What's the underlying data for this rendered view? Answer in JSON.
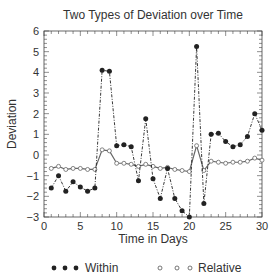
{
  "chart_data": {
    "type": "line",
    "title": "Two Types of Deviation over Time",
    "xlabel": "Time in Days",
    "ylabel": "Deviation",
    "xlim": [
      0,
      30
    ],
    "ylim": [
      -3,
      6
    ],
    "xticks": [
      0,
      5,
      10,
      15,
      20,
      25,
      30
    ],
    "yticks": [
      -3,
      -2,
      -1,
      0,
      1,
      2,
      3,
      4,
      5,
      6
    ],
    "grid": false,
    "legend_position": "bottom",
    "x": [
      1,
      2,
      3,
      4,
      5,
      6,
      7,
      8,
      9,
      10,
      11,
      12,
      13,
      14,
      15,
      16,
      17,
      18,
      19,
      20,
      21,
      22,
      23,
      24,
      25,
      26,
      27,
      28,
      29,
      30
    ],
    "series": [
      {
        "name": "Within",
        "marker": "filled-circle",
        "line": "dash-dot",
        "values": [
          -1.6,
          -1.0,
          -1.75,
          -1.3,
          -1.55,
          -1.75,
          -1.6,
          4.1,
          4.05,
          0.45,
          0.5,
          0.4,
          -1.25,
          1.75,
          -1.15,
          -2.1,
          -0.65,
          -2.1,
          -2.7,
          -3.0,
          5.25,
          -2.35,
          1.0,
          1.05,
          0.65,
          0.4,
          0.5,
          0.9,
          2.0,
          1.2
        ]
      },
      {
        "name": "Relative",
        "marker": "open-circle",
        "line": "solid",
        "values": [
          -0.65,
          -0.55,
          -0.7,
          -0.65,
          -0.65,
          -0.7,
          -0.7,
          0.25,
          0.2,
          -0.4,
          -0.4,
          -0.45,
          -0.55,
          -0.45,
          -0.55,
          -0.65,
          -0.6,
          -0.7,
          -0.75,
          -0.8,
          0.45,
          -0.75,
          -0.3,
          -0.35,
          -0.4,
          -0.35,
          -0.35,
          -0.3,
          -0.15,
          -0.25
        ]
      }
    ]
  },
  "legend": {
    "within_label": "Within",
    "relative_label": "Relative"
  }
}
